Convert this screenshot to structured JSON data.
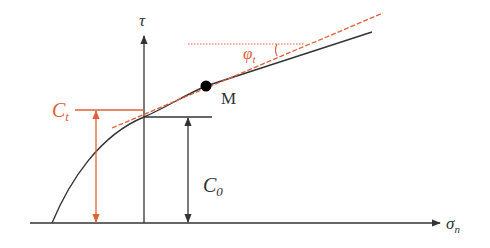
{
  "diagram": {
    "type": "shear strength envelope (Mohr-Coulomb tangent)",
    "colors": {
      "axis": "#333333",
      "curve": "#333333",
      "accent": "#e0603a",
      "point": "#000000"
    },
    "axes": {
      "y_label": "τ",
      "x_label": "σ",
      "x_label_sub": "n"
    },
    "labels": {
      "ct": "C",
      "ct_sub": "t",
      "c0": "C",
      "c0_sub": "0",
      "phi": "φ",
      "phi_sub": "t",
      "point_m": "M"
    },
    "elements": [
      {
        "name": "failure envelope curve",
        "description": "nonlinear curve from σn axis, becoming linear"
      },
      {
        "name": "tangent line at M",
        "style": "dashed",
        "color": "accent"
      },
      {
        "name": "horizontal reference line",
        "style": "dotted",
        "color": "accent"
      },
      {
        "name": "Ct intercept marker",
        "color": "accent"
      },
      {
        "name": "C0 intercept marker",
        "color": "axis"
      }
    ]
  }
}
